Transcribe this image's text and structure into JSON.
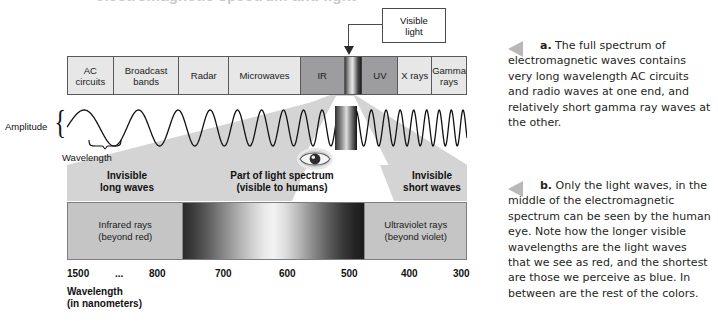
{
  "figure": {
    "cropped_title": "electromagnetic spectrum and light",
    "spectrum_bands": [
      {
        "label": "AC\ncircuits",
        "shade": "light"
      },
      {
        "label": "Broadcast\nbands",
        "shade": "light"
      },
      {
        "label": "Radar",
        "shade": "light"
      },
      {
        "label": "Microwaves",
        "shade": "light"
      },
      {
        "label": "IR",
        "shade": "dark"
      },
      {
        "label": "",
        "shade": "visible"
      },
      {
        "label": "UV",
        "shade": "dark"
      },
      {
        "label": "X rays",
        "shade": "light"
      },
      {
        "label": "Gamma\nrays",
        "shade": "light"
      }
    ],
    "callout": {
      "label": "Visible\nlight"
    },
    "wave": {
      "amplitude_label": "Amplitude",
      "wavelength_label": "Wavelength"
    },
    "sections": [
      {
        "label": "Invisible\nlong waves"
      },
      {
        "label": "Part of light spectrum\n(visible to humans)"
      },
      {
        "label": "Invisible\nshort waves"
      }
    ],
    "spectrum_bar": {
      "infrared_label": "Infrared rays\n(beyond red)",
      "ultraviolet_label": "Ultraviolet rays\n(beyond violet)"
    },
    "scale": {
      "ticks": [
        "1500",
        "...",
        "800",
        "700",
        "600",
        "500",
        "400",
        "300"
      ],
      "caption": "Wavelength\n(in nanometers)"
    }
  },
  "captions": {
    "a": {
      "marker": "a.",
      "text": "The full spectrum of electromagnetic waves contains very long wavelength AC circuits and radio waves at one end, and relatively short gamma ray waves at the other."
    },
    "b": {
      "marker": "b.",
      "text": "Only the light waves, in the middle of the electromagnetic spectrum can be seen by the human eye. Note how the longer visible wavelengths are the light waves that we see as red, and the shortest are those we perceive as blue. In between are the rest of the colors."
    }
  },
  "chart_data": {
    "type": "table",
    "bands": [
      "AC circuits",
      "Broadcast bands",
      "Radar",
      "Microwaves",
      "IR",
      "Visible light",
      "UV",
      "X rays",
      "Gamma rays"
    ],
    "wavelength_axis_nm": [
      1500,
      800,
      700,
      600,
      500,
      400,
      300
    ],
    "xlabel": "Wavelength (in nanometers)",
    "regions": [
      "Invisible long waves",
      "Part of light spectrum (visible to humans)",
      "Invisible short waves"
    ],
    "grid": false,
    "legend": "none"
  },
  "colors": {
    "band_light": "#e7e7e7",
    "band_dark": "#9d9d9f",
    "outline": "#59595b",
    "text": "#1b1b1b",
    "caption_text": "#231f20",
    "triangle": "#b8b8b8",
    "funnel": "#d9d9d9"
  }
}
